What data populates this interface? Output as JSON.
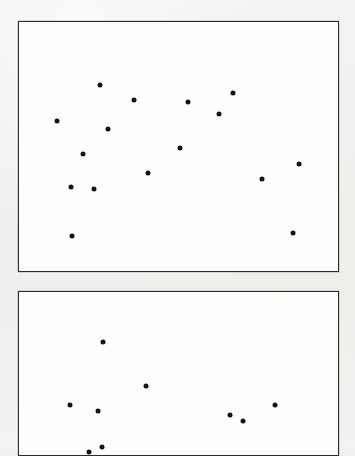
{
  "figure": {
    "kind": "scatter-plot-pair",
    "background_color": "#f1f1ef",
    "panel_background_color": "#fdfdfc",
    "panel_border_color": "#2a2a2a",
    "marker_color": "#141414",
    "marker_diameter_px": 5,
    "panels": [
      {
        "name": "top-scatter-panel",
        "frame": {
          "x": 18,
          "y": 21,
          "width": 321,
          "height": 251
        },
        "clipped": false
      },
      {
        "name": "bottom-scatter-panel",
        "frame": {
          "x": 18,
          "y": 291,
          "width": 321,
          "height": 165
        },
        "clipped": true
      }
    ]
  },
  "chart_data": [
    {
      "type": "scatter",
      "title": "",
      "subtitle": "",
      "xlabel": "",
      "ylabel": "",
      "xlim": [
        0,
        321
      ],
      "ylim": [
        0,
        251
      ],
      "grid": false,
      "legend": null,
      "axis_ticks": {
        "x": [],
        "y": []
      },
      "annotations": [],
      "marker": {
        "shape": "circle",
        "color": "#141414",
        "size_px": 5
      },
      "n_points": 16,
      "points": [
        {
          "x": 81,
          "y": 63
        },
        {
          "x": 115,
          "y": 78
        },
        {
          "x": 38,
          "y": 99
        },
        {
          "x": 89,
          "y": 107
        },
        {
          "x": 169,
          "y": 80
        },
        {
          "x": 200,
          "y": 92
        },
        {
          "x": 214,
          "y": 71
        },
        {
          "x": 64,
          "y": 132
        },
        {
          "x": 129,
          "y": 151
        },
        {
          "x": 52,
          "y": 165
        },
        {
          "x": 75,
          "y": 167
        },
        {
          "x": 53,
          "y": 214
        },
        {
          "x": 280,
          "y": 142
        },
        {
          "x": 243,
          "y": 157
        },
        {
          "x": 274,
          "y": 211
        },
        {
          "x": 161,
          "y": 126
        }
      ]
    },
    {
      "type": "scatter",
      "title": "",
      "subtitle": "",
      "xlabel": "",
      "ylabel": "",
      "xlim": [
        0,
        321
      ],
      "ylim": [
        0,
        165
      ],
      "grid": false,
      "legend": null,
      "axis_ticks": {
        "x": [],
        "y": []
      },
      "annotations": [],
      "marker": {
        "shape": "circle",
        "color": "#141414",
        "size_px": 5
      },
      "n_points": 9,
      "points": [
        {
          "x": 84,
          "y": 50
        },
        {
          "x": 127,
          "y": 94
        },
        {
          "x": 51,
          "y": 113
        },
        {
          "x": 79,
          "y": 119
        },
        {
          "x": 211,
          "y": 123
        },
        {
          "x": 224,
          "y": 129
        },
        {
          "x": 256,
          "y": 113
        },
        {
          "x": 83,
          "y": 155
        },
        {
          "x": 70,
          "y": 160
        }
      ]
    }
  ]
}
